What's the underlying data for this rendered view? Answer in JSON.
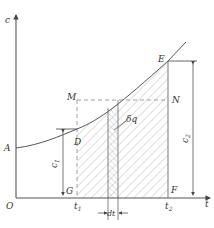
{
  "diagram": {
    "type": "concentration-time integral diagram",
    "axes": {
      "y_label": "c",
      "x_label": "t",
      "origin_label": "O"
    },
    "points": {
      "A": "A",
      "D": "D",
      "E": "E",
      "M": "M",
      "N": "N",
      "G": "G",
      "F": "F"
    },
    "ticks": {
      "t1": "t",
      "t1_sub": "1",
      "t2": "t",
      "t2_sub": "2"
    },
    "dimensions": {
      "c1": "c",
      "c1_sub": "1",
      "c2": "c",
      "c2_sub": "2",
      "dt": "dt"
    },
    "annotations": {
      "element": "δq"
    },
    "colors": {
      "line": "#555555",
      "hatch": "#9a9a9a",
      "dashed": "#888888",
      "text": "#333333",
      "background": "#ffffff"
    }
  }
}
